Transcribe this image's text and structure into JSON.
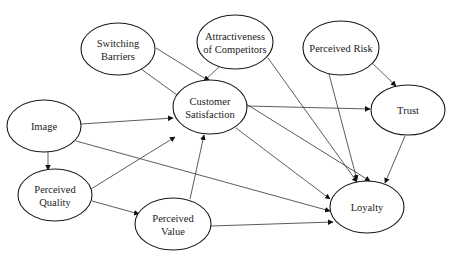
{
  "diagram": {
    "type": "path-model",
    "colors": {
      "stroke": "#1a1a1a",
      "text": "#222222",
      "background": "#ffffff"
    },
    "nodes": [
      {
        "id": "switching_barriers",
        "lines": [
          "Switching",
          "Barriers"
        ],
        "cx": 118,
        "cy": 49,
        "rx": 37,
        "ry": 26
      },
      {
        "id": "attractiveness",
        "lines": [
          "Attractiveness",
          "of Competitors"
        ],
        "cx": 235,
        "cy": 42,
        "rx": 38,
        "ry": 27
      },
      {
        "id": "perceived_risk",
        "lines": [
          "Perceived Risk"
        ],
        "cx": 341,
        "cy": 48,
        "rx": 38,
        "ry": 27
      },
      {
        "id": "image",
        "lines": [
          "Image"
        ],
        "cx": 44,
        "cy": 126,
        "rx": 37,
        "ry": 26
      },
      {
        "id": "customer_satisfaction",
        "lines": [
          "Customer",
          "Satisfaction"
        ],
        "cx": 210,
        "cy": 107,
        "rx": 37,
        "ry": 27
      },
      {
        "id": "trust",
        "lines": [
          "Trust"
        ],
        "cx": 408,
        "cy": 110,
        "rx": 37,
        "ry": 25
      },
      {
        "id": "perceived_quality",
        "lines": [
          "Perceived",
          "Quality"
        ],
        "cx": 55,
        "cy": 195,
        "rx": 37,
        "ry": 26
      },
      {
        "id": "perceived_value",
        "lines": [
          "Perceived",
          "Value"
        ],
        "cx": 173,
        "cy": 224,
        "rx": 38,
        "ry": 26
      },
      {
        "id": "loyalty",
        "lines": [
          "Loyalty"
        ],
        "cx": 367,
        "cy": 207,
        "rx": 37,
        "ry": 26
      }
    ],
    "edges": [
      {
        "from": "switching_barriers",
        "to": "customer_satisfaction",
        "x1": 141,
        "y1": 69,
        "x2": 184,
        "y2": 100
      },
      {
        "from": "switching_barriers",
        "to": "loyalty",
        "x1": 156,
        "y1": 48,
        "x2": 370,
        "y2": 181
      },
      {
        "from": "attractiveness",
        "to": "customer_satisfaction",
        "x1": 220,
        "y1": 66,
        "x2": 204,
        "y2": 81
      },
      {
        "from": "attractiveness",
        "to": "loyalty",
        "x1": 268,
        "y1": 58,
        "x2": 357,
        "y2": 182
      },
      {
        "from": "perceived_risk",
        "to": "trust",
        "x1": 367,
        "y1": 58,
        "x2": 396,
        "y2": 86
      },
      {
        "from": "perceived_risk",
        "to": "loyalty",
        "x1": 329,
        "y1": 74,
        "x2": 357,
        "y2": 180
      },
      {
        "from": "image",
        "to": "customer_satisfaction",
        "x1": 81,
        "y1": 124,
        "x2": 173,
        "y2": 118
      },
      {
        "from": "image",
        "to": "perceived_quality",
        "x1": 48,
        "y1": 152,
        "x2": 48,
        "y2": 170
      },
      {
        "from": "image",
        "to": "loyalty",
        "x1": 76,
        "y1": 141,
        "x2": 330,
        "y2": 211
      },
      {
        "from": "customer_satisfaction",
        "to": "trust",
        "x1": 247,
        "y1": 106,
        "x2": 370,
        "y2": 109
      },
      {
        "from": "customer_satisfaction",
        "to": "loyalty",
        "x1": 236,
        "y1": 128,
        "x2": 330,
        "y2": 199
      },
      {
        "from": "trust",
        "to": "loyalty",
        "x1": 405,
        "y1": 136,
        "x2": 385,
        "y2": 183
      },
      {
        "from": "perceived_quality",
        "to": "customer_satisfaction",
        "x1": 91,
        "y1": 189,
        "x2": 175,
        "y2": 137
      },
      {
        "from": "perceived_quality",
        "to": "perceived_value",
        "x1": 92,
        "y1": 201,
        "x2": 139,
        "y2": 214
      },
      {
        "from": "perceived_value",
        "to": "customer_satisfaction",
        "x1": 190,
        "y1": 199,
        "x2": 204,
        "y2": 135
      },
      {
        "from": "perceived_value",
        "to": "loyalty",
        "x1": 211,
        "y1": 226,
        "x2": 333,
        "y2": 222
      }
    ]
  }
}
